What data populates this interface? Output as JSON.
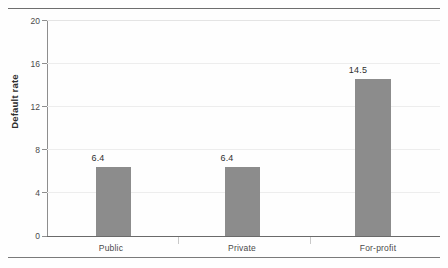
{
  "figure": {
    "background_color": "#fefefe",
    "rules": {
      "top_label": "top-rule",
      "bottom_label": "bottom-rule",
      "color": "#6e6e6e"
    }
  },
  "chart_data": {
    "type": "bar",
    "title": "",
    "subtitle": "",
    "xlabel": "",
    "ylabel": "Default rate",
    "categories": [
      "Public",
      "Private",
      "For-profit"
    ],
    "values": [
      6.4,
      6.4,
      14.5
    ],
    "value_labels": [
      "6.4",
      "6.4",
      "14.5"
    ],
    "ylim": [
      0,
      20
    ],
    "yticks": [
      0,
      4,
      8,
      12,
      16,
      20
    ],
    "ytick_labels": [
      "0",
      "4",
      "8",
      "12",
      "16",
      "20"
    ],
    "grid": true,
    "grid_axis": "y",
    "legend": false,
    "legend_position": "none",
    "bar_color": "#8c8c8c",
    "gridline_color": "#ededed",
    "axis_color": "#6a6a6a",
    "text_color": "#3a3a3a"
  },
  "axis": {
    "y_title": "Default rate",
    "ticks": [
      {
        "label": "20",
        "value": 20
      },
      {
        "label": "16",
        "value": 16
      },
      {
        "label": "12",
        "value": 12
      },
      {
        "label": "8",
        "value": 8
      },
      {
        "label": "4",
        "value": 4
      },
      {
        "label": "0",
        "value": 0
      }
    ]
  },
  "bars": [
    {
      "category": "Public",
      "value": 6.4,
      "label": "6.4"
    },
    {
      "category": "Private",
      "value": 6.4,
      "label": "6.4"
    },
    {
      "category": "For-profit",
      "value": 14.5,
      "label": "14.5"
    }
  ]
}
